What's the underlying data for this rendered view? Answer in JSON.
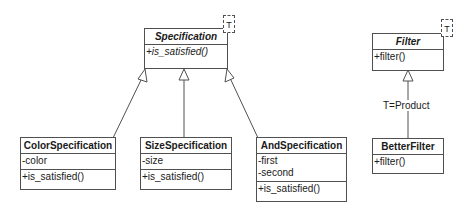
{
  "diagram": {
    "type": "UML class diagram",
    "classes": {
      "specification": {
        "name": "Specification",
        "abstract": true,
        "template_param": "T",
        "attributes": [],
        "methods": [
          "+is_satisfied()"
        ]
      },
      "color_specification": {
        "name": "ColorSpecification",
        "abstract": false,
        "attributes": [
          "-color"
        ],
        "methods": [
          "+is_satisfied()"
        ]
      },
      "size_specification": {
        "name": "SizeSpecification",
        "abstract": false,
        "attributes": [
          "-size"
        ],
        "methods": [
          "+is_satisfied()"
        ]
      },
      "and_specification": {
        "name": "AndSpecification",
        "abstract": false,
        "attributes": [
          "-first",
          "-second"
        ],
        "methods": [
          "+is_satisfied()"
        ]
      },
      "filter": {
        "name": "Filter",
        "abstract": true,
        "template_param": "T",
        "attributes": [],
        "methods": [
          "+filter()"
        ]
      },
      "better_filter": {
        "name": "BetterFilter",
        "abstract": false,
        "attributes": [],
        "methods": [
          "+filter()"
        ]
      }
    },
    "relations": [
      {
        "from": "ColorSpecification",
        "to": "Specification",
        "type": "generalization"
      },
      {
        "from": "SizeSpecification",
        "to": "Specification",
        "type": "generalization"
      },
      {
        "from": "AndSpecification",
        "to": "Specification",
        "type": "generalization"
      },
      {
        "from": "BetterFilter",
        "to": "Filter",
        "type": "generalization",
        "label": "T=Product"
      }
    ],
    "colors": {
      "line": "#505050",
      "text": "#1a1a1a",
      "background": "#ffffff"
    }
  }
}
